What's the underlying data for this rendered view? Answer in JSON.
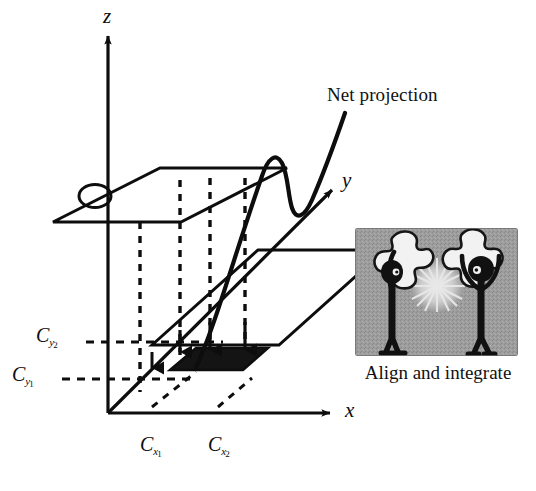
{
  "figure": {
    "background_color": "#ffffff",
    "ink_color": "#0d0d0d",
    "width": 536,
    "height": 491
  },
  "axes": {
    "z": {
      "label": "z",
      "direction": "up",
      "origin_px": [
        108,
        413
      ],
      "tip_px": [
        108,
        30
      ]
    },
    "y": {
      "label": "y",
      "direction": "up-right",
      "origin_px": [
        108,
        413
      ],
      "tip_px": [
        340,
        182
      ]
    },
    "x": {
      "label": "x",
      "direction": "right",
      "origin_px": [
        108,
        413
      ],
      "tip_px": [
        340,
        413
      ]
    }
  },
  "annotations": {
    "net_projection": "Net projection",
    "align_and_integrate": "Align and integrate"
  },
  "tick_labels": {
    "y_axis": [
      {
        "base": "C",
        "sub": "y",
        "index": "2",
        "value_px_y": 337
      },
      {
        "base": "C",
        "sub": "y",
        "index": "1",
        "value_px_y": 376
      }
    ],
    "x_axis": [
      {
        "base": "C",
        "sub": "x",
        "index": "1",
        "value_px_x": 152
      },
      {
        "base": "C",
        "sub": "x",
        "index": "2",
        "value_px_x": 218
      }
    ]
  },
  "planes": [
    {
      "name": "upper-plane",
      "style": "outline",
      "fill": "none",
      "stroke": "#0d0d0d"
    },
    {
      "name": "middle-plane",
      "style": "outline",
      "fill": "none",
      "stroke": "#0d0d0d"
    },
    {
      "name": "target-patch",
      "style": "filled",
      "fill": "#121212",
      "stroke": "#0d0d0d"
    }
  ],
  "marks": {
    "ellipse_on_upper_plane": {
      "name": "source-spot-ellipse",
      "cx": 95,
      "cy": 195,
      "rx": 15,
      "ry": 11
    },
    "projection_arrows": 3,
    "dashed_vertical_lines": 4,
    "dashed_horizontal_lines": 2
  },
  "photo": {
    "name": "align-and-integrate-illustration",
    "description": "Two stick figures holding jigsaw puzzle pieces toward each other with a starburst between them",
    "background": "#9a9a9a",
    "figures": 2,
    "puzzle_pieces": 2
  }
}
